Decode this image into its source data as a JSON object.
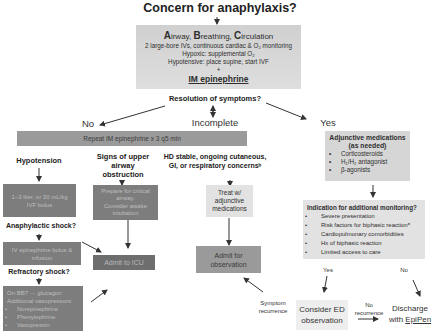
{
  "title": "Concern for anaphylaxis?",
  "abc_box": {
    "heading_parts": [
      {
        "cap": "A",
        "rest": "irway, "
      },
      {
        "cap": "B",
        "rest": "reathing, "
      },
      {
        "cap": "C",
        "rest": "irculation"
      }
    ],
    "lines": [
      "2 large-bore IVs, continuous cardiac & O₂ monitoring",
      "Hypoxic: supplemental O₂",
      "Hypotensive: place supine, start IVF",
      "+"
    ],
    "emphasis": "IM epinephrine"
  },
  "resolution_question": "Resolution of symptoms?",
  "branches": {
    "no": "No",
    "incomplete": "Incomplete",
    "yes": "Yes"
  },
  "repeat_box": "Repeat IM epinephrine x 3 q5 min",
  "hypotension": {
    "label": "Hypotension",
    "box": [
      "1–3 liter, or 30 mL/kg",
      "IVF bolus"
    ],
    "shock_q": "Anaphylactic shock?",
    "shock_box": [
      "IV epinephrine bolus &",
      "infusion"
    ],
    "refractory_q": "Refractory shock?",
    "refractory_box": {
      "lines": [
        "On BB? → glucagon",
        "Additional vasopressors:"
      ],
      "items": [
        "Norepinephrine",
        "Phenylephrine",
        "Vasopressin"
      ]
    }
  },
  "airway": {
    "label": [
      "Signs of upper airway",
      "obstruction"
    ],
    "box": [
      "Prepare for critical",
      "airway.",
      "Consider awake",
      "intubation"
    ]
  },
  "admit_icu": "Admit to ICU",
  "hd_stable": {
    "label": [
      "HD stable, ongoing cutaneous,",
      "GI, or respiratory concernsᵇ"
    ],
    "box": [
      "Treat w/",
      "adjunctive",
      "medications"
    ],
    "admit": [
      "Admit for",
      "observation"
    ]
  },
  "adjunctive": {
    "title": [
      "Adjunctive medications",
      "(as needed)"
    ],
    "items": [
      "Corticosteroids",
      "H₁/H₂ antagonist",
      "β-agonists"
    ]
  },
  "monitoring": {
    "title": "Indication for additional monitoring?",
    "items": [
      "Severe presentation",
      "Risk factors for biphasic reactionᵃ",
      "Cardiopulmonary comorbidities",
      "Hx of biphasic reaction",
      "Limited access to care"
    ],
    "yes": "Yes",
    "no": "No"
  },
  "ed_observation": [
    "Consider ED",
    "observation"
  ],
  "symptom_recurrence": [
    "Symptom",
    "recurrence"
  ],
  "no_recurrence": [
    "No",
    "recurrence"
  ],
  "discharge": {
    "line1": "Discharge",
    "line2_pre": "with ",
    "line2_link": "EpiPen"
  },
  "colors": {
    "dark_box": "#7d7d7d",
    "mid_box": "#9a9a9a",
    "light_box": "#d6d6d6",
    "lighter_box": "#e2e2e2"
  }
}
